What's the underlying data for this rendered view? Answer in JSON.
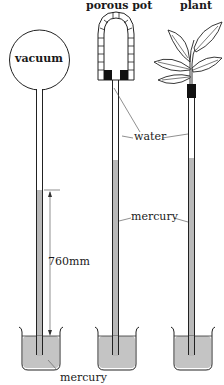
{
  "diagram": {
    "title_labels": {
      "vacuum": "vacuum",
      "porous_pot": "porous pot",
      "plant": "plant"
    },
    "annotations": {
      "water": "water",
      "mercury_middle": "mercury",
      "mercury_bottom": "mercury",
      "height": "760mm"
    },
    "colors": {
      "mercury_fill": "#b9b9b9",
      "outline": "#222222",
      "plug": "#111111",
      "background": "#ffffff"
    },
    "apparatus": [
      {
        "name": "vacuum",
        "description": "Sealed glass bulb with vacuum above a mercury column"
      },
      {
        "name": "porous pot",
        "description": "Porous pot filled with water atop a mercury column"
      },
      {
        "name": "plant",
        "description": "Leafy shoot sealed into a water-filled tube above mercury"
      }
    ]
  }
}
